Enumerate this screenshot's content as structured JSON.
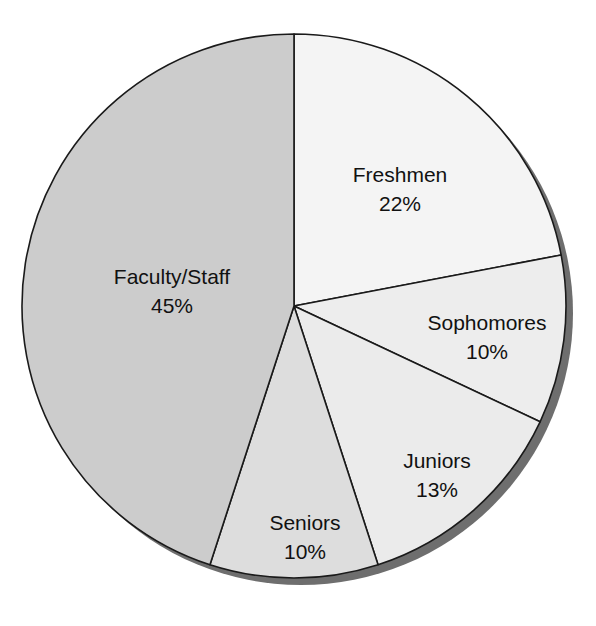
{
  "chart_data": {
    "type": "pie",
    "title": "",
    "subtitle": "",
    "xlabel": "",
    "ylabel": "",
    "legend_position": "none",
    "grid": false,
    "labels_inside_slices": true,
    "start_angle_deg": 0,
    "direction": "clockwise",
    "categories": [
      "Freshmen",
      "Sophomores",
      "Juniors",
      "Seniors",
      "Faculty/Staff"
    ],
    "values": [
      22,
      10,
      13,
      10,
      45
    ],
    "value_suffix": "%",
    "slices": [
      {
        "name": "Freshmen",
        "label": "Freshmen",
        "value": 22,
        "value_text": "22%",
        "color": "#f4f4f4",
        "label_x": 400,
        "label_y": 176,
        "value_x": 400,
        "value_y": 205
      },
      {
        "name": "Sophomores",
        "label": "Sophomores",
        "value": 10,
        "value_text": "10%",
        "color": "#ededed",
        "label_x": 487,
        "label_y": 324,
        "value_x": 487,
        "value_y": 353
      },
      {
        "name": "Juniors",
        "label": "Juniors",
        "value": 13,
        "value_text": "13%",
        "color": "#ebebeb",
        "label_x": 437,
        "label_y": 462,
        "value_x": 437,
        "value_y": 491
      },
      {
        "name": "Seniors",
        "label": "Seniors",
        "value": 10,
        "value_text": "10%",
        "color": "#dddddd",
        "label_x": 305,
        "label_y": 524,
        "value_x": 305,
        "value_y": 553
      },
      {
        "name": "Faculty/Staff",
        "label": "Faculty/Staff",
        "value": 45,
        "value_text": "45%",
        "color": "#cccccc",
        "label_x": 172,
        "label_y": 278,
        "value_x": 172,
        "value_y": 307
      }
    ],
    "geometry": {
      "center_x": 294,
      "center_y": 306,
      "radius": 272,
      "shadow_offset_x": 7,
      "shadow_offset_y": 7,
      "shadow_color": "#6e6e6e",
      "outline_color": "#1a1a1a",
      "outline_width": 1.6,
      "background": "#ffffff"
    }
  }
}
